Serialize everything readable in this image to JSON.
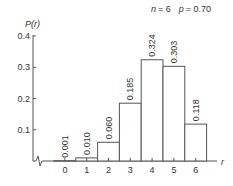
{
  "chart_data": {
    "type": "bar",
    "params": {
      "n": 6,
      "p": 0.7
    },
    "xlabel": "r",
    "ylabel": "P(r)",
    "categories": [
      "0",
      "1",
      "2",
      "3",
      "4",
      "5",
      "6"
    ],
    "values": [
      0.001,
      0.01,
      0.06,
      0.185,
      0.324,
      0.303,
      0.118
    ],
    "value_labels": [
      "0.001",
      "0.010",
      "0.060",
      "0.185",
      "0.324",
      "0.303",
      "0.118"
    ],
    "yticks": [
      "0.1",
      "0.2",
      "0.3",
      "0.4"
    ],
    "ylim": [
      0,
      0.4
    ],
    "grid": false,
    "legend": null,
    "axis_break": "y-axis origin shows break symbol"
  },
  "labels": {
    "n_label": "n",
    "n_value": "= 6",
    "p_label": "p",
    "p_value": "= 0.70",
    "ylabel": "P(r)",
    "xlabel": "r"
  }
}
